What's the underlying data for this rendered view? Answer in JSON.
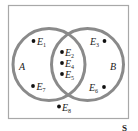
{
  "diagram": {
    "type": "venn",
    "universe_label": "S",
    "sets": [
      {
        "name": "A"
      },
      {
        "name": "B"
      }
    ],
    "colors": {
      "circle_stroke": "#8a8a8a",
      "border": "#a8a8a8",
      "text": "#222222"
    },
    "elements": [
      {
        "id": "E1",
        "letter": "E",
        "index": "1",
        "region": "A only"
      },
      {
        "id": "E7",
        "letter": "E",
        "index": "7",
        "region": "A only"
      },
      {
        "id": "E2",
        "letter": "E",
        "index": "2",
        "region": "A and B"
      },
      {
        "id": "E4",
        "letter": "E",
        "index": "4",
        "region": "A and B"
      },
      {
        "id": "E5",
        "letter": "E",
        "index": "5",
        "region": "A and B"
      },
      {
        "id": "E3",
        "letter": "E",
        "index": "3",
        "region": "B only"
      },
      {
        "id": "E6",
        "letter": "E",
        "index": "6",
        "region": "B only"
      },
      {
        "id": "E8",
        "letter": "E",
        "index": "8",
        "region": "outside A and B"
      }
    ]
  }
}
